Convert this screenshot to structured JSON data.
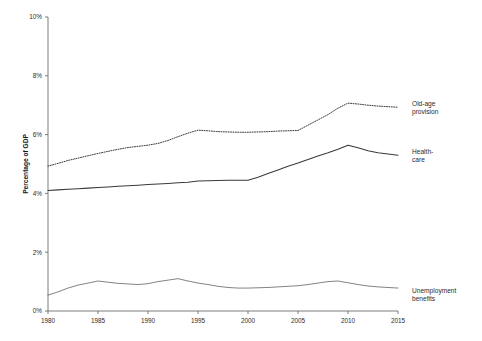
{
  "chart_data": {
    "type": "line",
    "title": "",
    "xlabel": "",
    "ylabel": "Percentage of GDP",
    "xlim": [
      1980,
      2015
    ],
    "ylim": [
      0,
      10
    ],
    "grid": false,
    "legend_position": "right-inline",
    "y_tick_labels": [
      "0%",
      "2%",
      "4%",
      "6%",
      "8%",
      "10%"
    ],
    "y_tick_values": [
      0,
      2,
      4,
      6,
      8,
      10
    ],
    "x_tick_labels": [
      "1980",
      "1985",
      "1990",
      "1995",
      "2000",
      "2005",
      "2010",
      "2015"
    ],
    "x_tick_values": [
      1980,
      1985,
      1990,
      1995,
      2000,
      2005,
      2010,
      2015
    ],
    "x": [
      1980,
      1981,
      1982,
      1983,
      1984,
      1985,
      1986,
      1987,
      1988,
      1989,
      1990,
      1991,
      1992,
      1993,
      1994,
      1995,
      1996,
      1997,
      1998,
      1999,
      2000,
      2001,
      2002,
      2003,
      2004,
      2005,
      2006,
      2007,
      2008,
      2009,
      2010,
      2011,
      2012,
      2013,
      2014,
      2015
    ],
    "series": [
      {
        "name": "Old-age provision",
        "label_line1": "Old-age",
        "label_line2": "provision",
        "style": "dotted",
        "color": "#3a3a3a",
        "values": [
          4.93,
          5.02,
          5.12,
          5.2,
          5.28,
          5.36,
          5.43,
          5.5,
          5.56,
          5.6,
          5.64,
          5.7,
          5.8,
          5.93,
          6.05,
          6.15,
          6.13,
          6.1,
          6.09,
          6.08,
          6.08,
          6.09,
          6.1,
          6.12,
          6.13,
          6.14,
          6.32,
          6.5,
          6.68,
          6.9,
          7.07,
          7.04,
          7.0,
          6.97,
          6.95,
          6.93
        ]
      },
      {
        "name": "Health-care",
        "label_line1": "Health-",
        "label_line2": "care",
        "style": "solid",
        "color": "#3a3a3a",
        "values": [
          4.1,
          4.12,
          4.14,
          4.16,
          4.18,
          4.2,
          4.22,
          4.24,
          4.26,
          4.28,
          4.3,
          4.32,
          4.34,
          4.36,
          4.38,
          4.42,
          4.43,
          4.44,
          4.45,
          4.45,
          4.45,
          4.55,
          4.68,
          4.8,
          4.92,
          5.03,
          5.15,
          5.27,
          5.38,
          5.5,
          5.64,
          5.55,
          5.45,
          5.38,
          5.34,
          5.3
        ]
      },
      {
        "name": "Unemployment benefits",
        "label_line1": "Unemployment",
        "label_line2": "benefits",
        "style": "thin",
        "color": "#5a5a5a",
        "values": [
          0.54,
          0.65,
          0.78,
          0.88,
          0.95,
          1.02,
          0.98,
          0.94,
          0.92,
          0.9,
          0.93,
          1.0,
          1.05,
          1.1,
          1.02,
          0.95,
          0.9,
          0.84,
          0.8,
          0.78,
          0.78,
          0.79,
          0.8,
          0.82,
          0.84,
          0.86,
          0.9,
          0.95,
          1.0,
          1.02,
          0.96,
          0.9,
          0.85,
          0.82,
          0.8,
          0.78
        ]
      }
    ]
  }
}
